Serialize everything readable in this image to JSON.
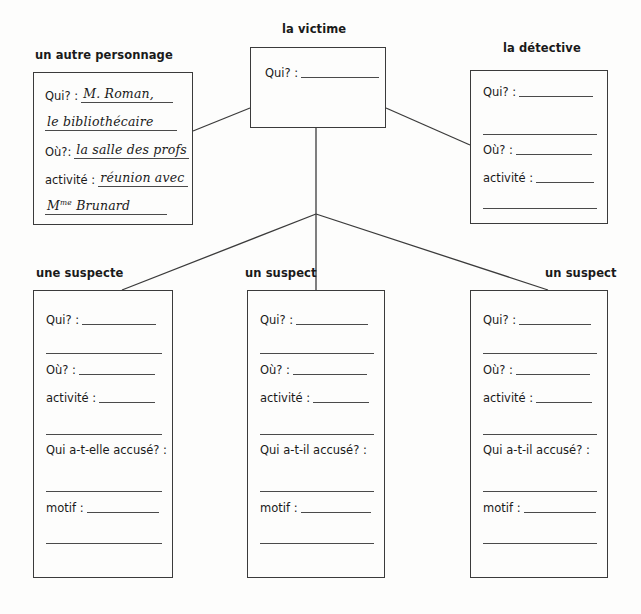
{
  "worksheet": {
    "title": "Murder mystery character chart",
    "nodes": {
      "victim": {
        "heading": "la victime",
        "fields": [
          {
            "label": "Qui? :"
          }
        ]
      },
      "other_character": {
        "heading": "un autre personnage",
        "fields": [
          {
            "label": "Qui? :",
            "value": "M. Roman,"
          },
          {
            "label": "",
            "value": "le bibliothécaire"
          },
          {
            "label": "Où?:",
            "value": "la salle des profs"
          },
          {
            "label": "activité :",
            "value": "réunion avec"
          },
          {
            "label": "",
            "value_prefix": "M",
            "value_sup": "me",
            "value_rest": " Brunard"
          }
        ]
      },
      "detective": {
        "heading": "la détective",
        "fields": [
          {
            "label": "Qui? :"
          },
          {
            "label": ""
          },
          {
            "label": "Où? :"
          },
          {
            "label": "activité :"
          },
          {
            "label": ""
          }
        ]
      },
      "suspect_female": {
        "heading": "une suspecte",
        "fields": [
          {
            "label": "Qui? :"
          },
          {
            "label": ""
          },
          {
            "label": "Où? :"
          },
          {
            "label": "activité :"
          },
          {
            "label": ""
          },
          {
            "label": "Qui a-t-elle accusé? :"
          },
          {
            "label": ""
          },
          {
            "label": "motif :"
          },
          {
            "label": ""
          }
        ]
      },
      "suspect_male_1": {
        "heading": "un suspect",
        "fields": [
          {
            "label": "Qui? :"
          },
          {
            "label": ""
          },
          {
            "label": "Où? :"
          },
          {
            "label": "activité :"
          },
          {
            "label": ""
          },
          {
            "label": "Qui a-t-il accusé? :"
          },
          {
            "label": ""
          },
          {
            "label": "motif :"
          },
          {
            "label": ""
          }
        ]
      },
      "suspect_male_2": {
        "heading": "un suspect",
        "fields": [
          {
            "label": "Qui? :"
          },
          {
            "label": ""
          },
          {
            "label": "Où? :"
          },
          {
            "label": "activité :"
          },
          {
            "label": ""
          },
          {
            "label": "Qui a-t-il accusé? :"
          },
          {
            "label": ""
          },
          {
            "label": "motif :"
          },
          {
            "label": ""
          }
        ]
      }
    },
    "colors": {
      "background": "#fdfdfc",
      "ink": "#1a1a1a",
      "line": "#3b3b3b",
      "rule": "#4a4a4a"
    }
  }
}
